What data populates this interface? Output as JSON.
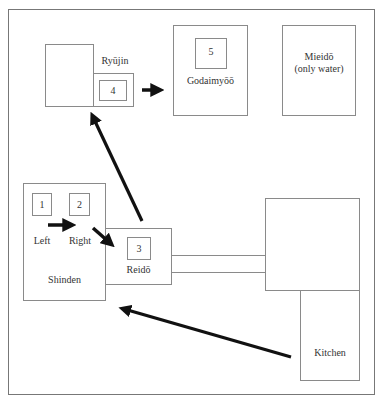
{
  "diagram": {
    "type": "floor-plan-route",
    "rooms": {
      "ryujin": {
        "label": "Ryūjin",
        "number": "4"
      },
      "godaimyoo": {
        "label": "Godaimyōō",
        "number": "5"
      },
      "mieido": {
        "label_line1": "Mieidō",
        "label_line2": "(only water)"
      },
      "shinden": {
        "label": "Shinden",
        "left_label": "Left",
        "right_label": "Right",
        "left_number": "1",
        "right_number": "2"
      },
      "reido": {
        "label": "Reidō",
        "number": "3"
      },
      "kitchen": {
        "label": "Kitchen"
      }
    },
    "route": [
      "Kitchen",
      "Shinden",
      "1 Left",
      "2 Right",
      "3 Reidō",
      "4 Ryūjin",
      "5 Godaimyōō"
    ],
    "colors": {
      "line": "#8a8a8a",
      "arrow": "#111111",
      "text": "#333333"
    }
  }
}
